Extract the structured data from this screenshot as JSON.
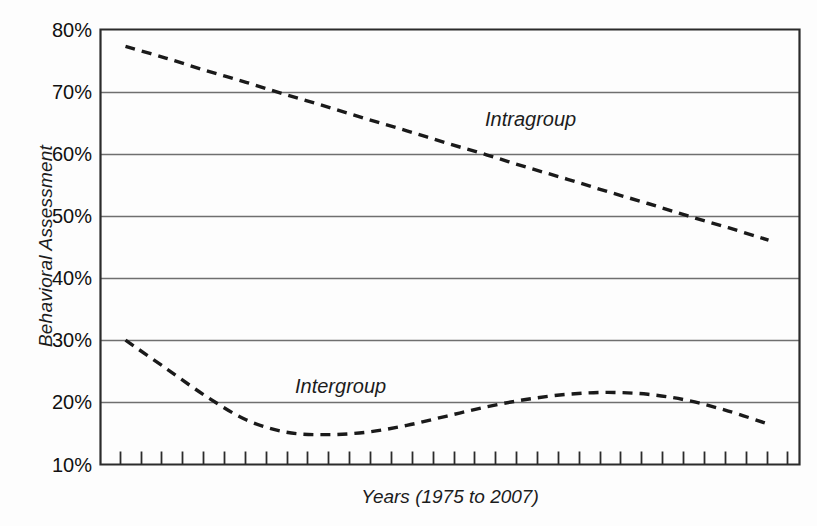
{
  "chart_data": {
    "type": "line",
    "title": "",
    "xlabel": "Years (1975 to 2007)",
    "ylabel": "Behavioral Assessment",
    "ylim": [
      10,
      80
    ],
    "xlim": [
      1975,
      2007
    ],
    "y_tick_labels": [
      "80%",
      "70%",
      "60%",
      "50%",
      "40%",
      "30%",
      "20%",
      "10%"
    ],
    "y_ticks": [
      80,
      70,
      60,
      50,
      40,
      30,
      20,
      10
    ],
    "grid": true,
    "grid_axis": "y",
    "legend": "inline-annotations",
    "x_tick_count": 33,
    "x_tick_labels": [],
    "line_style": "dashed",
    "line_color": "#1a1a1a",
    "series": [
      {
        "name": "Intragroup",
        "label_x": 1989,
        "label_y": 65,
        "x": [
          1975,
          1977,
          1979,
          1981,
          1983,
          1985,
          1987,
          1989,
          1991,
          1993,
          1995,
          1997,
          1999,
          2001,
          2003,
          2005,
          2007
        ],
        "values": [
          77.3,
          75.4,
          73.4,
          71.5,
          69.5,
          67.6,
          65.6,
          63.7,
          61.7,
          59.8,
          57.8,
          55.9,
          53.9,
          52.0,
          50.0,
          48.1,
          46.1
        ]
      },
      {
        "name": "Intergroup",
        "label_x": 1983,
        "label_y": 25,
        "x": [
          1975,
          1977,
          1979,
          1981,
          1983,
          1985,
          1987,
          1989,
          1991,
          1993,
          1995,
          1997,
          1999,
          2001,
          2003,
          2005,
          2007
        ],
        "values": [
          30.0,
          25.5,
          21.0,
          17.2,
          15.2,
          14.8,
          15.2,
          16.3,
          17.8,
          19.3,
          20.5,
          21.3,
          21.6,
          21.3,
          20.3,
          18.6,
          16.5
        ]
      }
    ],
    "axis_box_color": "#2b2b2b",
    "gridline_color": "#6f6f6f"
  }
}
